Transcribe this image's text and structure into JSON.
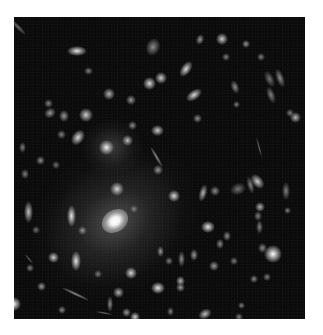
{
  "figure": {
    "background_color": "#ffffff",
    "photo_background": "#0b0b0b",
    "photo_box": {
      "left": 14,
      "top": 17,
      "width": 291,
      "height": 302
    },
    "central_galaxy": {
      "x": 101,
      "y": 204,
      "rx": 40,
      "ry": 32,
      "brightness": 1.0
    },
    "objects": [
      {
        "x": 63,
        "y": 34,
        "w": 16,
        "h": 6,
        "rot": 0,
        "b": 0.9
      },
      {
        "x": 139,
        "y": 30,
        "w": 10,
        "h": 14,
        "rot": 20,
        "b": 0.55
      },
      {
        "x": 74,
        "y": 54,
        "w": 5,
        "h": 4,
        "rot": 0,
        "b": 0.5
      },
      {
        "x": 34,
        "y": 86,
        "w": 5,
        "h": 5,
        "rot": 0,
        "b": 0.5
      },
      {
        "x": 135,
        "y": 66,
        "w": 9,
        "h": 9,
        "rot": 0,
        "b": 0.85
      },
      {
        "x": 95,
        "y": 77,
        "w": 8,
        "h": 8,
        "rot": 0,
        "b": 0.7
      },
      {
        "x": 72,
        "y": 98,
        "w": 10,
        "h": 10,
        "rot": 0,
        "b": 0.8
      },
      {
        "x": 36,
        "y": 96,
        "w": 8,
        "h": 6,
        "rot": -30,
        "b": 0.6
      },
      {
        "x": 117,
        "y": 83,
        "w": 6,
        "h": 6,
        "rot": 0,
        "b": 0.6
      },
      {
        "x": 186,
        "y": 22,
        "w": 4,
        "h": 7,
        "rot": 20,
        "b": 0.6
      },
      {
        "x": 208,
        "y": 22,
        "w": 8,
        "h": 8,
        "rot": 0,
        "b": 0.8
      },
      {
        "x": 232,
        "y": 27,
        "w": 4,
        "h": 4,
        "rot": 0,
        "b": 0.6
      },
      {
        "x": 212,
        "y": 40,
        "w": 4,
        "h": 4,
        "rot": 0,
        "b": 0.5
      },
      {
        "x": 247,
        "y": 40,
        "w": 4,
        "h": 4,
        "rot": 0,
        "b": 0.5
      },
      {
        "x": 172,
        "y": 52,
        "w": 6,
        "h": 14,
        "rot": 35,
        "b": 0.85
      },
      {
        "x": 147,
        "y": 61,
        "w": 8,
        "h": 8,
        "rot": 0,
        "b": 0.8
      },
      {
        "x": 180,
        "y": 78,
        "w": 6,
        "h": 14,
        "rot": 55,
        "b": 0.85
      },
      {
        "x": 266,
        "y": 61,
        "w": 4,
        "h": 16,
        "rot": -20,
        "b": 0.55
      },
      {
        "x": 255,
        "y": 62,
        "w": 5,
        "h": 14,
        "rot": -25,
        "b": 0.45
      },
      {
        "x": 257,
        "y": 78,
        "w": 4,
        "h": 14,
        "rot": -20,
        "b": 0.5
      },
      {
        "x": 221,
        "y": 70,
        "w": 4,
        "h": 10,
        "rot": -20,
        "b": 0.55
      },
      {
        "x": 222,
        "y": 87,
        "w": 3,
        "h": 3,
        "rot": 0,
        "b": 0.5
      },
      {
        "x": 276,
        "y": 96,
        "w": 4,
        "h": 4,
        "rot": 0,
        "b": 0.5
      },
      {
        "x": 281,
        "y": 100,
        "w": 7,
        "h": 7,
        "rot": 0,
        "b": 0.7
      },
      {
        "x": 183,
        "y": 101,
        "w": 5,
        "h": 5,
        "rot": 0,
        "b": 0.55
      },
      {
        "x": 92,
        "y": 130,
        "w": 11,
        "h": 11,
        "rot": 0,
        "b": 0.95
      },
      {
        "x": 113,
        "y": 123,
        "w": 7,
        "h": 7,
        "rot": 0,
        "b": 0.75
      },
      {
        "x": 118,
        "y": 108,
        "w": 5,
        "h": 5,
        "rot": 0,
        "b": 0.55
      },
      {
        "x": 143,
        "y": 113,
        "w": 9,
        "h": 7,
        "rot": 0,
        "b": 0.8
      },
      {
        "x": 50,
        "y": 99,
        "w": 6,
        "h": 8,
        "rot": 0,
        "b": 0.6
      },
      {
        "x": 64,
        "y": 120,
        "w": 8,
        "h": 13,
        "rot": 35,
        "b": 0.85
      },
      {
        "x": 47,
        "y": 117,
        "w": 5,
        "h": 5,
        "rot": 0,
        "b": 0.5
      },
      {
        "x": 26,
        "y": 143,
        "w": 5,
        "h": 5,
        "rot": 0,
        "b": 0.55
      },
      {
        "x": 42,
        "y": 148,
        "w": 4,
        "h": 4,
        "rot": 0,
        "b": 0.45
      },
      {
        "x": 11,
        "y": 157,
        "w": 4,
        "h": 6,
        "rot": 0,
        "b": 0.5
      },
      {
        "x": 8,
        "y": 130,
        "w": 3,
        "h": 7,
        "rot": 0,
        "b": 0.5
      },
      {
        "x": 57,
        "y": 199,
        "w": 5,
        "h": 18,
        "rot": 0,
        "b": 0.9
      },
      {
        "x": 103,
        "y": 172,
        "w": 10,
        "h": 10,
        "rot": 0,
        "b": 0.85
      },
      {
        "x": 120,
        "y": 192,
        "w": 4,
        "h": 4,
        "rot": 0,
        "b": 0.55
      },
      {
        "x": 68,
        "y": 213,
        "w": 5,
        "h": 5,
        "rot": 0,
        "b": 0.6
      },
      {
        "x": 14,
        "y": 195,
        "w": 5,
        "h": 18,
        "rot": 0,
        "b": 0.75
      },
      {
        "x": 160,
        "y": 179,
        "w": 8,
        "h": 8,
        "rot": 0,
        "b": 0.85
      },
      {
        "x": 144,
        "y": 153,
        "w": 6,
        "h": 6,
        "rot": 0,
        "b": 0.6
      },
      {
        "x": 189,
        "y": 176,
        "w": 4,
        "h": 14,
        "rot": 15,
        "b": 0.7
      },
      {
        "x": 201,
        "y": 174,
        "w": 6,
        "h": 6,
        "rot": 0,
        "b": 0.55
      },
      {
        "x": 194,
        "y": 210,
        "w": 10,
        "h": 8,
        "rot": 0,
        "b": 0.9
      },
      {
        "x": 243,
        "y": 164,
        "w": 7,
        "h": 13,
        "rot": -40,
        "b": 0.8
      },
      {
        "x": 236,
        "y": 168,
        "w": 3,
        "h": 14,
        "rot": -15,
        "b": 0.5
      },
      {
        "x": 272,
        "y": 174,
        "w": 4,
        "h": 14,
        "rot": 0,
        "b": 0.5
      },
      {
        "x": 273,
        "y": 193,
        "w": 3,
        "h": 3,
        "rot": 0,
        "b": 0.5
      },
      {
        "x": 246,
        "y": 190,
        "w": 6,
        "h": 6,
        "rot": 0,
        "b": 0.7
      },
      {
        "x": 224,
        "y": 172,
        "w": 12,
        "h": 8,
        "rot": -20,
        "b": 0.45
      },
      {
        "x": 244,
        "y": 199,
        "w": 4,
        "h": 6,
        "rot": 0,
        "b": 0.5
      },
      {
        "x": 245,
        "y": 210,
        "w": 3,
        "h": 10,
        "rot": 0,
        "b": 0.5
      },
      {
        "x": 213,
        "y": 219,
        "w": 4,
        "h": 6,
        "rot": 0,
        "b": 0.55
      },
      {
        "x": 206,
        "y": 227,
        "w": 4,
        "h": 6,
        "rot": 0,
        "b": 0.55
      },
      {
        "x": 248,
        "y": 231,
        "w": 5,
        "h": 6,
        "rot": 0,
        "b": 0.55
      },
      {
        "x": 180,
        "y": 238,
        "w": 4,
        "h": 8,
        "rot": 0,
        "b": 0.6
      },
      {
        "x": 220,
        "y": 244,
        "w": 4,
        "h": 4,
        "rot": 0,
        "b": 0.5
      },
      {
        "x": 22,
        "y": 213,
        "w": 4,
        "h": 4,
        "rot": 0,
        "b": 0.45
      },
      {
        "x": 39,
        "y": 240,
        "w": 7,
        "h": 7,
        "rot": 0,
        "b": 0.8
      },
      {
        "x": 62,
        "y": 244,
        "w": 6,
        "h": 16,
        "rot": 0,
        "b": 0.9
      },
      {
        "x": 16,
        "y": 251,
        "w": 4,
        "h": 4,
        "rot": 0,
        "b": 0.5
      },
      {
        "x": 27,
        "y": 269,
        "w": 5,
        "h": 5,
        "rot": 0,
        "b": 0.6
      },
      {
        "x": 84,
        "y": 257,
        "w": 4,
        "h": 4,
        "rot": 0,
        "b": 0.5
      },
      {
        "x": 104,
        "y": 275,
        "w": 7,
        "h": 7,
        "rot": 0,
        "b": 0.7
      },
      {
        "x": 117,
        "y": 256,
        "w": 8,
        "h": 8,
        "rot": 0,
        "b": 0.85
      },
      {
        "x": 0,
        "y": 287,
        "w": 10,
        "h": 10,
        "rot": 0,
        "b": 0.95
      },
      {
        "x": 48,
        "y": 293,
        "w": 4,
        "h": 4,
        "rot": 0,
        "b": 0.55
      },
      {
        "x": 112,
        "y": 295,
        "w": 5,
        "h": 5,
        "rot": 0,
        "b": 0.6
      },
      {
        "x": 146,
        "y": 234,
        "w": 3,
        "h": 7,
        "rot": 0,
        "b": 0.6
      },
      {
        "x": 155,
        "y": 244,
        "w": 4,
        "h": 4,
        "rot": 0,
        "b": 0.5
      },
      {
        "x": 167,
        "y": 242,
        "w": 3,
        "h": 12,
        "rot": 0,
        "b": 0.55
      },
      {
        "x": 200,
        "y": 249,
        "w": 6,
        "h": 6,
        "rot": 0,
        "b": 0.6
      },
      {
        "x": 259,
        "y": 237,
        "w": 14,
        "h": 14,
        "rot": 0,
        "b": 1.0
      },
      {
        "x": 240,
        "y": 262,
        "w": 4,
        "h": 4,
        "rot": 0,
        "b": 0.55
      },
      {
        "x": 253,
        "y": 260,
        "w": 4,
        "h": 4,
        "rot": 0,
        "b": 0.5
      },
      {
        "x": 166,
        "y": 264,
        "w": 5,
        "h": 6,
        "rot": 0,
        "b": 0.7
      },
      {
        "x": 166,
        "y": 270,
        "w": 5,
        "h": 5,
        "rot": 0,
        "b": 0.6
      },
      {
        "x": 144,
        "y": 271,
        "w": 10,
        "h": 8,
        "rot": 0,
        "b": 0.9
      },
      {
        "x": 191,
        "y": 297,
        "w": 10,
        "h": 6,
        "rot": -30,
        "b": 0.75
      },
      {
        "x": 227,
        "y": 288,
        "w": 3,
        "h": 3,
        "rot": 0,
        "b": 0.5
      },
      {
        "x": 156,
        "y": 294,
        "w": 3,
        "h": 5,
        "rot": 0,
        "b": 0.5
      },
      {
        "x": 121,
        "y": 300,
        "w": 6,
        "h": 6,
        "rot": 0,
        "b": 0.8
      },
      {
        "x": 96,
        "y": 287,
        "w": 2,
        "h": 12,
        "rot": 0,
        "b": 0.55
      },
      {
        "x": 225,
        "y": 300,
        "w": 4,
        "h": 4,
        "rot": 0,
        "b": 0.5
      }
    ],
    "arcs": [
      {
        "x": 4,
        "y": 10,
        "w": 4,
        "h": 20,
        "rot": -45,
        "b": 0.5
      },
      {
        "x": 142,
        "y": 140,
        "w": 3,
        "h": 22,
        "rot": -30,
        "b": 0.65
      },
      {
        "x": 61,
        "y": 277,
        "w": 3,
        "h": 28,
        "rot": -65,
        "b": 0.65
      },
      {
        "x": 90,
        "y": 296,
        "w": 2,
        "h": 16,
        "rot": -80,
        "b": 0.5
      },
      {
        "x": 245,
        "y": 130,
        "w": 2,
        "h": 20,
        "rot": -15,
        "b": 0.5
      },
      {
        "x": 15,
        "y": 242,
        "w": 2,
        "h": 12,
        "rot": -40,
        "b": 0.45
      }
    ],
    "caption_text": ""
  }
}
